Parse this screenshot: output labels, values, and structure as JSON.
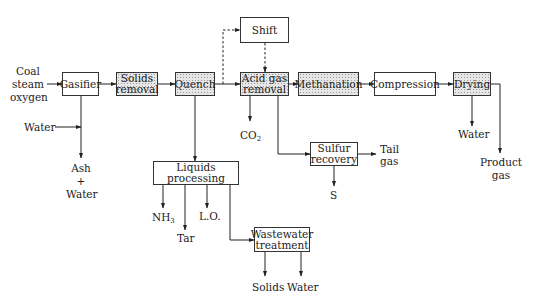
{
  "diagram": {
    "type": "process-flow"
  },
  "units": {
    "gasifier": {
      "label": "Gasifier",
      "shaded": false
    },
    "solids_removal": {
      "label1": "Solids",
      "label2": "removal",
      "shaded": true
    },
    "quench": {
      "label": "Quench",
      "shaded": true
    },
    "shift": {
      "label": "Shift",
      "shaded": false
    },
    "acid_gas_removal": {
      "label1": "Acid gas",
      "label2": "removal",
      "shaded": true
    },
    "methanation": {
      "label": "Methanation",
      "shaded": true
    },
    "compression": {
      "label": "Compression",
      "shaded": false
    },
    "drying": {
      "label": "Drying",
      "shaded": true
    },
    "sulfur_recovery": {
      "label1": "Sulfur",
      "label2": "recovery",
      "shaded": false
    },
    "liquids_processing": {
      "label": "Liquids processing",
      "shaded": false
    },
    "wastewater_treatment": {
      "label1": "Wastewater",
      "label2": "treatment",
      "shaded": false
    }
  },
  "streams": {
    "feed": {
      "line1": "Coal",
      "line2": "steam",
      "line3": "oxygen"
    },
    "water_in": "Water",
    "ash_water": {
      "line1": "Ash",
      "line2": "+",
      "line3": "Water"
    },
    "co2": {
      "main": "CO",
      "sub": "2"
    },
    "tail_gas": {
      "line1": "Tail",
      "line2": "gas"
    },
    "sulfur": "S",
    "drying_water": "Water",
    "product_gas": {
      "line1": "Product",
      "line2": "gas"
    },
    "nh3": {
      "main": "NH",
      "sub": "3"
    },
    "tar": "Tar",
    "lo": "L.O.",
    "solids": "Solids",
    "ww_water": "Water"
  },
  "flows": [
    {
      "from": "feed",
      "to": "gasifier"
    },
    {
      "from": "gasifier",
      "to": "solids_removal"
    },
    {
      "from": "solids_removal",
      "to": "quench"
    },
    {
      "from": "quench",
      "to": "acid_gas_removal"
    },
    {
      "from": "quench",
      "to": "shift",
      "style": "dashed"
    },
    {
      "from": "shift",
      "to": "acid_gas_removal",
      "style": "dashed"
    },
    {
      "from": "acid_gas_removal",
      "to": "methanation"
    },
    {
      "from": "methanation",
      "to": "compression"
    },
    {
      "from": "compression",
      "to": "drying"
    },
    {
      "from": "drying",
      "to": "product_gas"
    },
    {
      "from": "drying",
      "to": "drying_water"
    },
    {
      "from": "water_in",
      "to": "gasifier_bottom"
    },
    {
      "from": "gasifier",
      "to": "ash_water"
    },
    {
      "from": "acid_gas_removal",
      "to": "co2"
    },
    {
      "from": "acid_gas_removal",
      "to": "sulfur_recovery"
    },
    {
      "from": "sulfur_recovery",
      "to": "tail_gas"
    },
    {
      "from": "sulfur_recovery",
      "to": "sulfur"
    },
    {
      "from": "quench",
      "to": "liquids_processing"
    },
    {
      "from": "liquids_processing",
      "to": "nh3"
    },
    {
      "from": "liquids_processing",
      "to": "tar"
    },
    {
      "from": "liquids_processing",
      "to": "lo"
    },
    {
      "from": "liquids_processing",
      "to": "wastewater_treatment"
    },
    {
      "from": "wastewater_treatment",
      "to": "solids"
    },
    {
      "from": "wastewater_treatment",
      "to": "ww_water"
    }
  ]
}
